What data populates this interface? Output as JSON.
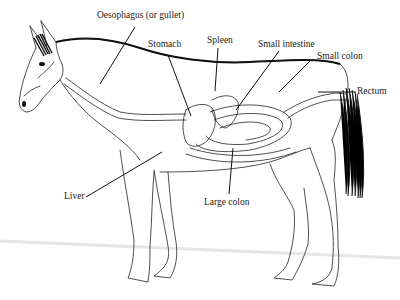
{
  "diagram": {
    "colors": {
      "line": "#222222",
      "hair": "#111111",
      "background": "#ffffff",
      "floor_shadow": "#e6e6e6"
    },
    "labels": [
      {
        "id": "oesophagus",
        "text": "Oesophagus (or gullet)"
      },
      {
        "id": "stomach",
        "text": "Stomach"
      },
      {
        "id": "spleen",
        "text": "Spleen"
      },
      {
        "id": "small_intestine",
        "text": "Small intestine"
      },
      {
        "id": "small_colon",
        "text": "Small colon"
      },
      {
        "id": "rectum",
        "text": "Rectum"
      },
      {
        "id": "liver",
        "text": "Liver"
      },
      {
        "id": "large_colon",
        "text": "Large colon"
      }
    ]
  }
}
